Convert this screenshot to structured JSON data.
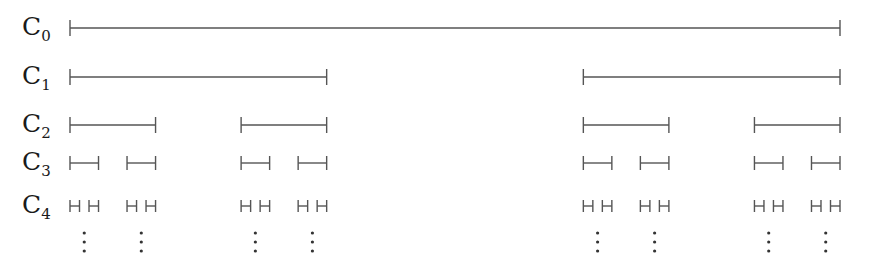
{
  "rows": [
    {
      "label": "C",
      "sub": "0",
      "y": 28,
      "level": 0
    },
    {
      "label": "C",
      "sub": "1",
      "y": 77,
      "level": 1
    },
    {
      "label": "C",
      "sub": "2",
      "y": 125,
      "level": 2
    },
    {
      "label": "C",
      "sub": "3",
      "y": 163,
      "level": 3
    },
    {
      "label": "C",
      "sub": "4",
      "y": 206,
      "level": 4
    }
  ],
  "interval": {
    "x_start": 70,
    "x_end": 840
  },
  "ellipsis": {
    "symbol": "⋮",
    "y": [
      233,
      242,
      251
    ]
  },
  "colors": {
    "line": "#555555",
    "text": "#1a1a1a",
    "dots": "#333333"
  }
}
